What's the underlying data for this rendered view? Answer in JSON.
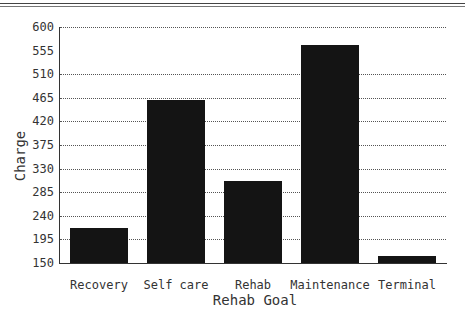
{
  "chart_data": {
    "type": "bar",
    "title": "",
    "xlabel": "Rehab Goal",
    "ylabel": "Charge",
    "categories": [
      "Recovery",
      "Self care",
      "Rehab",
      "Maintenance",
      "Terminal"
    ],
    "values": [
      216,
      461,
      307,
      566,
      163
    ],
    "ylim": [
      150,
      600
    ],
    "yticks": [
      "150",
      "195",
      "240",
      "285",
      "330",
      "375",
      "420",
      "465",
      "510",
      "555",
      "600"
    ],
    "grid": true,
    "legend": null,
    "bar_color": "#141414"
  }
}
